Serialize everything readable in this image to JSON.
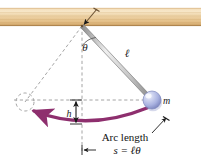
{
  "figure": {
    "kind": "physics-diagram",
    "width": 201,
    "height": 161,
    "background_color": "#ffffff"
  },
  "ceiling": {
    "name": "wooden-support-beam",
    "color_light": "#f6e3c2",
    "color_mid": "#e7c48d",
    "color_dark": "#c79a5c",
    "grain_color": "#d9b27c",
    "x": 0,
    "y": 8,
    "width": 201,
    "height": 18
  },
  "pivot": {
    "name": "pivot-point",
    "x": 82,
    "y": 26,
    "pointer_color": "#6b5234"
  },
  "rod": {
    "name": "pendulum-rod",
    "from_x": 82,
    "from_y": 26,
    "to_x": 150,
    "to_y": 98,
    "stroke": "#7a7a7a",
    "fill": "#d8d8d8",
    "thickness": 4
  },
  "bob": {
    "name": "pendulum-bob",
    "cx": 152,
    "cy": 100,
    "r": 9,
    "color_highlight": "#e8eaf8",
    "color_mid": "#aeb6e2",
    "color_edge": "#7b84bd",
    "label": "m"
  },
  "phantom_bob": {
    "name": "phantom-bob-outline",
    "cx": 25,
    "cy": 102,
    "r": 9,
    "stroke": "#9a9a9a"
  },
  "dashes": {
    "color": "#9a9a9a",
    "vertical_from_y": 26,
    "vertical_to_y": 152,
    "vertical_x": 82,
    "horizontal_y": 100,
    "horizontal_from_x": 14,
    "horizontal_to_x": 150,
    "diagonal_to_x": 25,
    "diagonal_to_y": 102
  },
  "arc": {
    "name": "swing-arc",
    "color": "#8e2f6e",
    "stroke_width": 3.4,
    "start_x": 145,
    "start_y": 110,
    "end_x": 33,
    "end_y": 112,
    "apex_x": 86,
    "apex_y": 126
  },
  "labels": {
    "theta": {
      "text": "θ",
      "x": 88,
      "y": 46
    },
    "length": {
      "text": "ℓ",
      "x": 127,
      "y": 56
    },
    "mass": {
      "text": "m",
      "x": 164,
      "y": 104
    },
    "height": {
      "text": "h",
      "x": 70,
      "y": 116
    }
  },
  "annotation": {
    "name": "arc-length-annotation",
    "title": "Arc length",
    "title_x": 124,
    "title_y": 140,
    "equation": "s = ℓθ",
    "equation_x": 126,
    "equation_y": 153
  },
  "height_arrow": {
    "name": "height-measure-arrow",
    "x": 76,
    "top_y": 100,
    "bottom_y": 124,
    "color": "#1a1a1a"
  },
  "leaders": {
    "color": "#1a1a1a",
    "arc_leader": {
      "x1": 155,
      "y1": 132,
      "x2": 168,
      "y2": 118
    },
    "base_leader": {
      "x1": 60,
      "y1": 150,
      "x2": 86,
      "y2": 150
    },
    "pivot_leader": {
      "x1": 96,
      "y1": 10,
      "x2": 84,
      "y2": 25
    }
  }
}
